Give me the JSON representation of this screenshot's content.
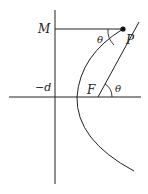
{
  "diagram": {
    "type": "geometry-figure",
    "labels": {
      "M": "M",
      "P": "P",
      "F": "F",
      "neg_d": "−d",
      "theta_p": "θ",
      "theta_f": "θ"
    },
    "colors": {
      "stroke": "#222222",
      "background": "#ffffff"
    }
  }
}
